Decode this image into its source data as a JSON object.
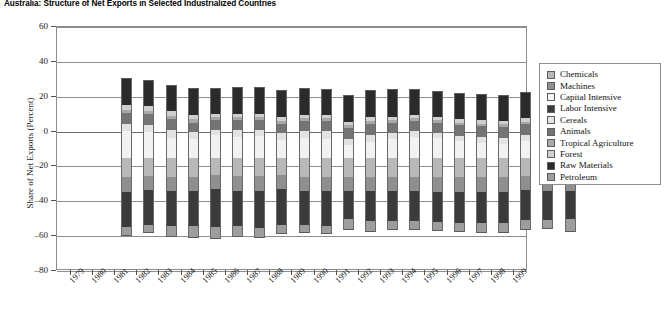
{
  "title": "Australia: Structure of Net Exports in Selected Industrialized Countries",
  "axes": {
    "ylabel": "Share of Net Exports (Percent)",
    "yticks": [
      60,
      40,
      20,
      0,
      -20,
      -40,
      -60,
      -80
    ],
    "ymin": -80,
    "ymax": 60,
    "grid": true
  },
  "legend": {
    "position": "right",
    "items": [
      {
        "label": "Chemicals",
        "color": "#b8b8b8"
      },
      {
        "label": "Machines",
        "color": "#8f8f8f"
      },
      {
        "label": "Capital Intensive",
        "color": "#f2f2f2"
      },
      {
        "label": "Labor Intensive",
        "color": "#3b3b3b"
      },
      {
        "label": "Cereals",
        "color": "#e2e2e2"
      },
      {
        "label": "Animals",
        "color": "#747474"
      },
      {
        "label": "Tropical Agriculture",
        "color": "#a8a8a8"
      },
      {
        "label": "Forest",
        "color": "#cfcfcf"
      },
      {
        "label": "Raw Materials",
        "color": "#2b2b2b"
      },
      {
        "label": "Petroleum",
        "color": "#9d9d9d"
      }
    ]
  },
  "chart_data": {
    "type": "bar",
    "stacked": true,
    "title": "Australia: Structure of Net Exports in Selected Industrialized Countries",
    "xlabel": "",
    "ylabel": "Share of Net Exports (Percent)",
    "ylim": [
      -80,
      60
    ],
    "categories": [
      "1979",
      "1980",
      "1981",
      "1982",
      "1983",
      "1984",
      "1985",
      "1986",
      "1987",
      "1988",
      "1989",
      "1990",
      "1991",
      "1992",
      "1993",
      "1994",
      "1995",
      "1996",
      "1997",
      "1998",
      "1999"
    ],
    "series": [
      {
        "name": "Chemicals",
        "color": "#b8b8b8",
        "values": [
          -11.0,
          -10.5,
          -11.0,
          -11.0,
          -10.0,
          -10.5,
          -10.5,
          -10.0,
          -11.0,
          -11.0,
          -11.0,
          -11.0,
          -11.0,
          -11.0,
          -11.0,
          -11.0,
          -11.0,
          -11.0,
          -10.5,
          -11.0,
          -11.0
        ]
      },
      {
        "name": "Machines",
        "color": "#8f8f8f",
        "values": [
          -9.0,
          -8.0,
          -8.0,
          -8.0,
          -8.0,
          -8.5,
          -8.5,
          -8.0,
          -8.0,
          -8.0,
          -8.0,
          -8.0,
          -8.0,
          -8.0,
          -8.5,
          -8.5,
          -8.5,
          -8.5,
          -8.0,
          -8.0,
          -8.0
        ]
      },
      {
        "name": "Capital Intensive",
        "color": "#f2f2f2",
        "values": [
          15.5,
          14.5,
          11.5,
          10.5,
          13.0,
          12.0,
          12.5,
          10.0,
          11.5,
          10.5,
          7.0,
          9.0,
          10.5,
          12.0,
          11.0,
          9.5,
          8.5,
          8.0,
          9.5,
          11.5,
          7.5
        ]
      },
      {
        "name": "Labor Intensive",
        "color": "#3b3b3b",
        "values": [
          -20.0,
          -20.0,
          -20.0,
          -20.5,
          -22.0,
          -20.5,
          -21.5,
          -20.5,
          -19.5,
          -20.0,
          -16.5,
          -17.5,
          -17.5,
          -17.5,
          -17.5,
          -18.0,
          -18.0,
          -18.0,
          -17.5,
          -17.0,
          -16.0
        ]
      },
      {
        "name": "Cereals",
        "color": "#e2e2e2",
        "values": [
          3.5,
          4.0,
          4.5,
          4.0,
          3.0,
          4.0,
          3.5,
          4.0,
          3.5,
          4.5,
          3.5,
          4.0,
          3.5,
          3.0,
          3.0,
          3.0,
          3.5,
          3.5,
          3.5,
          3.5,
          3.5
        ]
      },
      {
        "name": "Animals",
        "color": "#747474",
        "values": [
          6.5,
          6.5,
          6.0,
          5.5,
          5.5,
          5.5,
          5.5,
          5.5,
          6.0,
          6.0,
          6.5,
          6.5,
          6.0,
          6.0,
          6.0,
          6.0,
          6.0,
          6.0,
          6.0,
          6.0,
          6.0
        ]
      },
      {
        "name": "Tropical Agriculture",
        "color": "#a8a8a8",
        "values": [
          2.0,
          2.0,
          2.0,
          2.0,
          1.5,
          1.5,
          1.5,
          1.5,
          1.5,
          1.5,
          1.5,
          1.5,
          1.5,
          1.5,
          1.5,
          1.5,
          1.5,
          1.5,
          1.5,
          1.5,
          1.5
        ]
      },
      {
        "name": "Forest",
        "color": "#cfcfcf",
        "values": [
          2.5,
          2.5,
          2.5,
          2.5,
          2.0,
          2.0,
          2.0,
          2.0,
          2.0,
          2.0,
          2.0,
          2.0,
          2.0,
          2.0,
          2.0,
          2.0,
          2.0,
          2.0,
          2.0,
          2.0,
          2.0
        ]
      },
      {
        "name": "Raw Materials",
        "color": "#2b2b2b",
        "values": [
          15.5,
          15.0,
          15.0,
          15.5,
          15.0,
          15.5,
          15.5,
          15.5,
          15.5,
          15.0,
          15.5,
          16.0,
          16.0,
          15.0,
          14.5,
          15.0,
          15.0,
          15.0,
          15.0,
          14.0,
          14.0
        ]
      },
      {
        "name": "Petroleum",
        "color": "#9d9d9d",
        "values": [
          -5.0,
          -5.0,
          -6.5,
          -6.5,
          -7.0,
          -6.0,
          -5.5,
          -5.5,
          -5.0,
          -5.0,
          -6.0,
          -6.0,
          -5.0,
          -5.0,
          -5.0,
          -5.0,
          -5.5,
          -5.5,
          -5.5,
          -5.0,
          -7.5
        ]
      }
    ]
  }
}
